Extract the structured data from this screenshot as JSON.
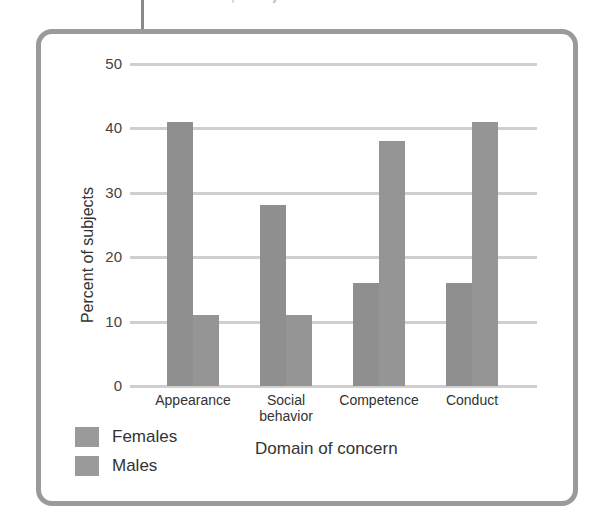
{
  "caption_fragment": "from Harter, 1990)",
  "chart_data": {
    "type": "bar",
    "title": "",
    "xlabel": "Domain of concern",
    "ylabel": "Percent of subjects",
    "categories": [
      "Appearance",
      "Social behavior",
      "Competence",
      "Conduct"
    ],
    "category_lines": [
      [
        "Appearance"
      ],
      [
        "Social",
        "behavior"
      ],
      [
        "Competence"
      ],
      [
        "Conduct"
      ]
    ],
    "series": [
      {
        "name": "Females",
        "values": [
          41,
          28,
          16,
          16
        ],
        "color": "#8f8f8f"
      },
      {
        "name": "Males",
        "values": [
          11,
          11,
          38,
          41
        ],
        "color": "#959595"
      }
    ],
    "ylim": [
      0,
      50
    ],
    "yticks": [
      0,
      10,
      20,
      30,
      40,
      50
    ],
    "grid": true,
    "legend_position": "bottom-left"
  },
  "legend": [
    {
      "label": "Females"
    },
    {
      "label": "Males"
    }
  ]
}
